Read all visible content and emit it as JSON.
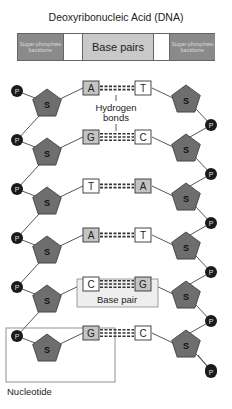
{
  "title": "Deoxyribonucleic Acid (DNA)",
  "legend": {
    "left_backbone": "Sugar-phosphate backbone",
    "bases": "Base pairs",
    "right_backbone": "Sugar-phosphate backbone"
  },
  "symbols": {
    "sugar": "S",
    "phosphate": "P"
  },
  "base_pairs": [
    {
      "left": "A",
      "right": "T",
      "bonds": 2
    },
    {
      "left": "G",
      "right": "C",
      "bonds": 3
    },
    {
      "left": "T",
      "right": "A",
      "bonds": 2
    },
    {
      "left": "A",
      "right": "T",
      "bonds": 2
    },
    {
      "left": "C",
      "right": "G",
      "bonds": 3
    },
    {
      "left": "G",
      "right": "C",
      "bonds": 3
    }
  ],
  "labels": {
    "hydrogen_bonds": [
      "Hydrogen",
      "bonds"
    ],
    "base_pair": "Base pair",
    "nucleotide": "Nucleotide"
  },
  "colors": {
    "sugar_fill": "#6e6e6e",
    "phosphate_fill": "#1a1a1a",
    "purine_box": "#c4c4c4",
    "pyrimidine_box": "#ffffff",
    "backbone_legend": "#8a8a8a",
    "line": "#444444"
  }
}
